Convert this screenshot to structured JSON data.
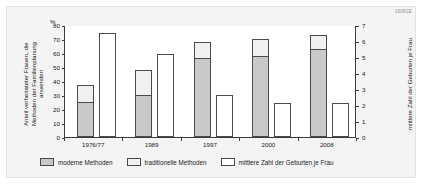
{
  "code": "16082E",
  "axes": {
    "left_title": "Anteil verheirateter Frauen, die\nMethoden der Familienplanung\nanwenden",
    "left_unit": "%",
    "right_title": "mittlere Zahl der Geburten je Frau"
  },
  "legend": {
    "items": [
      {
        "label": "moderne Methoden",
        "swatch": "modern",
        "color": "#c9c9c9"
      },
      {
        "label": "traditionelle Methoden",
        "swatch": "trad",
        "color": "#f0f0f0"
      },
      {
        "label": "mittlere Zahl der Geburten je Frau",
        "swatch": "births",
        "color": "#ffffff"
      }
    ]
  },
  "chart_data": {
    "type": "bar",
    "title": "",
    "subtitle": "",
    "categories": [
      "1976/77",
      "1989",
      "1997",
      "2000",
      "2008"
    ],
    "series": [
      {
        "name": "moderne Methoden",
        "axis": "left",
        "unit": "%",
        "values": [
          24,
          29,
          56,
          57,
          62
        ]
      },
      {
        "name": "traditionelle Methoden",
        "axis": "left",
        "unit": "%",
        "values": [
          13,
          19,
          12,
          13,
          11
        ]
      },
      {
        "name": "Methoden gesamt",
        "axis": "left",
        "unit": "%",
        "values": [
          37,
          48,
          68,
          70,
          73
        ]
      },
      {
        "name": "mittlere Zahl der Geburten je Frau",
        "axis": "right",
        "unit": "Geburten",
        "values": [
          6.5,
          5.2,
          2.6,
          2.1,
          2.1
        ]
      }
    ],
    "xlabel": "",
    "ylabel": "Anteil verheirateter Frauen, die Methoden der Familienplanung anwenden",
    "ylabel_right": "mittlere Zahl der Geburten je Frau",
    "ylim": [
      0,
      80
    ],
    "ylim_right": [
      0,
      7
    ],
    "yticks": [
      0,
      10,
      20,
      30,
      40,
      50,
      60,
      70,
      80
    ],
    "yticks_right": [
      0,
      1,
      2,
      3,
      4,
      5,
      6,
      7
    ],
    "grid": false,
    "legend_position": "bottom"
  }
}
